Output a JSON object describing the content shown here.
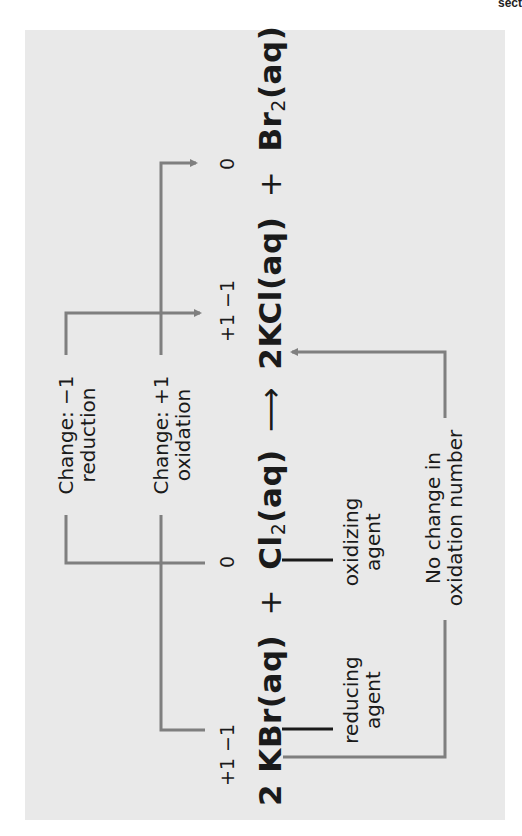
{
  "corner_text": "sect",
  "equation": {
    "reactant1": "2 KBr(aq)",
    "plus1": "+",
    "reactant2_symbol": "Cl",
    "reactant2_sub": "2",
    "reactant2_state": "(aq)",
    "arrow": "⟶",
    "product1": "2KCl(aq)",
    "plus2": "+",
    "product2_symbol": "Br",
    "product2_sub": "2",
    "product2_state": "(aq)"
  },
  "oxidation_numbers": {
    "kbr": "+1 −1",
    "cl2": "0",
    "kcl": "+1 −1",
    "br2": "0"
  },
  "labels": {
    "reduction_change": "Change: −1",
    "reduction_name": "reduction",
    "oxidation_change": "Change: +1",
    "oxidation_name": "oxidation",
    "reducing_agent_line1": "reducing",
    "reducing_agent_line2": "agent",
    "oxidizing_agent_line1": "oxidizing",
    "oxidizing_agent_line2": "agent",
    "no_change_line1": "No change in",
    "no_change_line2": "oxidation number"
  },
  "colors": {
    "panel_bg": "#e9e9e9",
    "connector_gray": "#7f7f7f",
    "tick_black": "#1a1a1a"
  }
}
